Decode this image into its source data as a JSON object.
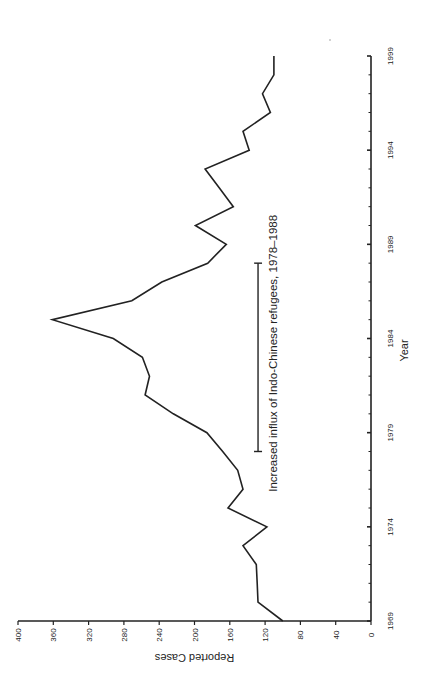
{
  "chart_data": {
    "type": "line",
    "title": "",
    "xlabel": "Year",
    "ylabel": "Reported Cases",
    "orientation_note": "figure rotated 90 degrees counter-clockwise",
    "xlim": [
      1969,
      1999
    ],
    "ylim": [
      0,
      400
    ],
    "x_ticks_major": [
      1969,
      1974,
      1979,
      1984,
      1989,
      1994,
      1999
    ],
    "y_ticks": [
      0,
      40,
      80,
      120,
      160,
      200,
      240,
      280,
      320,
      360,
      400
    ],
    "grid": false,
    "legend": null,
    "series": [
      {
        "name": "Reported Cases",
        "x": [
          1969,
          1970,
          1971,
          1972,
          1973,
          1974,
          1975,
          1976,
          1977,
          1978,
          1979,
          1980,
          1981,
          1982,
          1983,
          1984,
          1985,
          1986,
          1987,
          1988,
          1989,
          1990,
          1991,
          1992,
          1993,
          1994,
          1995,
          1996,
          1997,
          1998,
          1999
        ],
        "values": [
          100,
          128,
          129,
          130,
          145,
          118,
          162,
          145,
          151,
          168,
          186,
          224,
          256,
          251,
          259,
          292,
          361,
          271,
          237,
          185,
          164,
          199,
          156,
          172,
          188,
          138,
          145,
          114,
          123,
          110,
          110
        ]
      }
    ],
    "annotations": [
      {
        "type": "bracket",
        "text": "Increased influx of Indo-Chinese refugees, 1978–1988",
        "x_start": 1978,
        "x_end": 1988,
        "y_level": 128
      }
    ]
  }
}
